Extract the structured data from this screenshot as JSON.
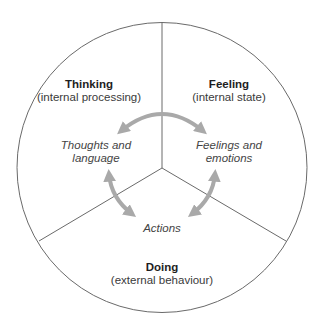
{
  "diagram": {
    "colors": {
      "outline": "#6a6a6a",
      "arrow": "#a9a9a9",
      "background": "#ffffff"
    },
    "segments": [
      {
        "id": "thinking",
        "title": "Thinking",
        "subtitle": "(internal processing)",
        "inner_label_line1": "Thoughts and",
        "inner_label_line2": "language"
      },
      {
        "id": "feeling",
        "title": "Feeling",
        "subtitle": "(internal state)",
        "inner_label_line1": "Feelings and",
        "inner_label_line2": "emotions"
      },
      {
        "id": "doing",
        "title": "Doing",
        "subtitle": "(external behaviour)",
        "inner_label_line1": "Actions"
      }
    ],
    "arrows": [
      {
        "from": "Thoughts and language",
        "to": "Feelings and emotions",
        "type": "bidirectional"
      },
      {
        "from": "Thoughts and language",
        "to": "Actions",
        "type": "bidirectional"
      },
      {
        "from": "Feelings and emotions",
        "to": "Actions",
        "type": "bidirectional"
      }
    ]
  }
}
